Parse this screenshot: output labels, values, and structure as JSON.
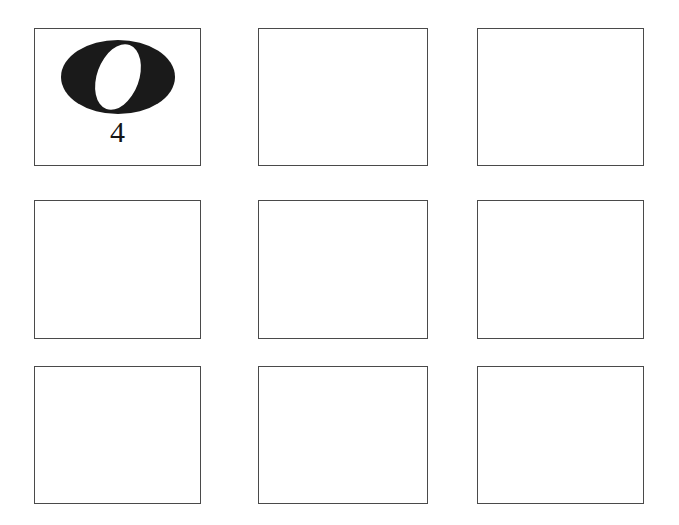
{
  "page": {
    "background_color": "#ffffff",
    "width": 679,
    "height": 525
  },
  "grid": {
    "rows": 3,
    "columns": 3,
    "cell_border_color": "#4a4a4a",
    "cell_fill_color": "#ffffff",
    "cells": [
      {
        "id": "cell-r0c0",
        "row": 0,
        "column": 0,
        "empty": false,
        "label": "4",
        "figure": {
          "name": "ellipse-ring",
          "description": "thick black horizontal ellipse with tilted white inner ellipse",
          "fill_color": "#1a1a1a",
          "inner_fill_color": "#ffffff",
          "outer_rx": 57,
          "outer_ry": 37,
          "inner_rx": 21,
          "inner_ry": 34,
          "inner_rotation_deg": 20
        }
      },
      {
        "id": "cell-r0c1",
        "row": 0,
        "column": 1,
        "empty": true,
        "label": "",
        "figure": null
      },
      {
        "id": "cell-r0c2",
        "row": 0,
        "column": 2,
        "empty": true,
        "label": "",
        "figure": null
      },
      {
        "id": "cell-r1c0",
        "row": 1,
        "column": 0,
        "empty": true,
        "label": "",
        "figure": null
      },
      {
        "id": "cell-r1c1",
        "row": 1,
        "column": 1,
        "empty": true,
        "label": "",
        "figure": null
      },
      {
        "id": "cell-r1c2",
        "row": 1,
        "column": 2,
        "empty": true,
        "label": "",
        "figure": null
      },
      {
        "id": "cell-r2c0",
        "row": 2,
        "column": 0,
        "empty": true,
        "label": "",
        "figure": null
      },
      {
        "id": "cell-r2c1",
        "row": 2,
        "column": 1,
        "empty": true,
        "label": "",
        "figure": null
      },
      {
        "id": "cell-r2c2",
        "row": 2,
        "column": 2,
        "empty": true,
        "label": "",
        "figure": null
      }
    ]
  }
}
